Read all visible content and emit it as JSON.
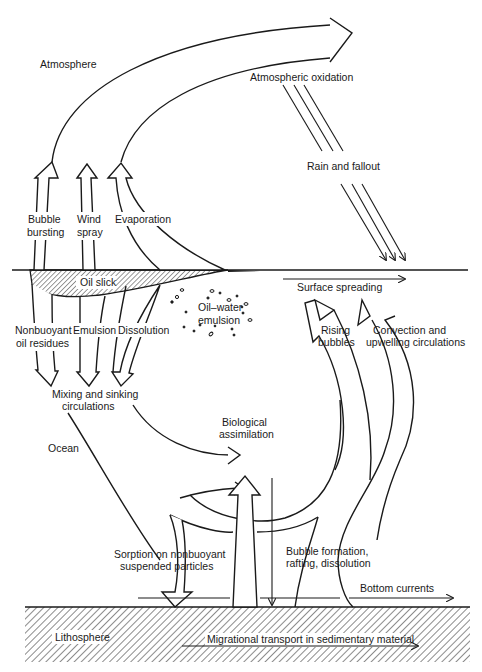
{
  "diagram": {
    "regions": {
      "atmosphere": "Atmosphere",
      "ocean": "Ocean",
      "lithosphere": "Lithosphere"
    },
    "labels": {
      "atmospheric_oxidation": "Atmospheric oxidation",
      "rain_fallout": "Rain and fallout",
      "bubble_bursting_1": "Bubble",
      "bubble_bursting_2": "bursting",
      "wind_spray_1": "Wind",
      "wind_spray_2": "spray",
      "evaporation": "Evaporation",
      "oil_slick": "Oil slick",
      "surface_spreading": "Surface spreading",
      "oil_water_1": "Oil–water",
      "oil_water_2": "emulsion",
      "nonbuoyant_1": "Nonbuoyant",
      "nonbuoyant_2": "oil residues",
      "emulsion": "Emulsion",
      "dissolution": "Dissolution",
      "rising_bubbles_1": "Rising",
      "rising_bubbles_2": "bubbles",
      "convection_1": "Convection and",
      "convection_2": "upwelling circulations",
      "mixing_1": "Mixing and sinking",
      "mixing_2": "circulations",
      "biological_1": "Biological",
      "biological_2": "assimilation",
      "sorption_1": "Sorption on nonbuoyant",
      "sorption_2": "suspended particles",
      "bubble_formation_1": "Bubble formation,",
      "bubble_formation_2": "rafting, dissolution",
      "bottom_currents": "Bottom currents",
      "migrational": "Migrational transport in sedimentary material"
    },
    "colors": {
      "ink": "#1a1a1a",
      "paper": "#ffffff"
    }
  }
}
